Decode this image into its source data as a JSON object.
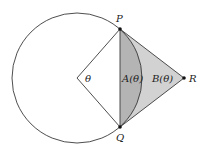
{
  "diagram": {
    "labels": {
      "P": "P",
      "Q": "Q",
      "R": "R",
      "theta": "θ",
      "A": "A(θ)",
      "B": "B(θ)"
    },
    "colors": {
      "stroke": "#3a3a3a",
      "segment_fill": "#b4b4b4",
      "triangle_fill": "#d2d2d2",
      "point": "#111111"
    }
  }
}
